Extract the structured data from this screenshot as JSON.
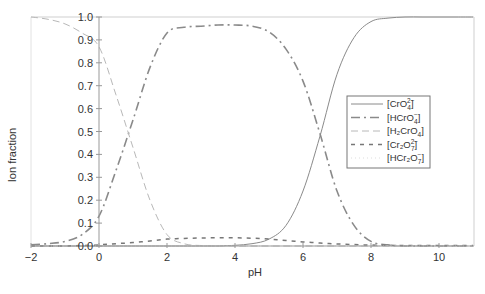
{
  "chart_data": {
    "type": "line",
    "title": "",
    "xlabel": "pH",
    "ylabel": "Ion fraction",
    "xlim": [
      -2,
      11
    ],
    "ylim": [
      0,
      1.0
    ],
    "x_ticks": [
      -2,
      0,
      2,
      4,
      6,
      8,
      10
    ],
    "x_tick_labels": [
      "−2",
      "0",
      "2",
      "4",
      "6",
      "8",
      "10"
    ],
    "y_ticks": [
      0.0,
      0.1,
      0.2,
      0.3,
      0.4,
      0.5,
      0.6,
      0.7,
      0.8,
      0.9,
      1.0
    ],
    "y_tick_labels": [
      "0.0",
      "0.1",
      "0.2",
      "0.3",
      "0.4",
      "0.5",
      "0.6",
      "0.7",
      "0.8",
      "0.9",
      "1.0"
    ],
    "grid": false,
    "legend_position": "right-center inside",
    "x": [
      -2,
      -1.5,
      -1,
      -0.5,
      0,
      0.5,
      1,
      1.5,
      2,
      2.5,
      3,
      3.5,
      4,
      4.5,
      5,
      5.5,
      6,
      6.5,
      7,
      7.5,
      8,
      8.5,
      9,
      9.5,
      10,
      10.5,
      11
    ],
    "series": [
      {
        "name": "[CrO4^2-]",
        "label": "[CrO₄²⁻]",
        "style": "solid",
        "values": [
          0,
          0,
          0,
          0,
          0,
          0,
          0,
          0,
          0,
          0,
          0,
          0,
          0.003,
          0.01,
          0.03,
          0.09,
          0.24,
          0.48,
          0.75,
          0.91,
          0.98,
          0.995,
          1.0,
          1.0,
          1.0,
          1.0,
          1.0
        ]
      },
      {
        "name": "[HCrO4^-]",
        "label": "[HCrO₄⁻]",
        "style": "dash-dot",
        "values": [
          0.005,
          0.01,
          0.02,
          0.05,
          0.13,
          0.33,
          0.55,
          0.78,
          0.93,
          0.955,
          0.96,
          0.965,
          0.965,
          0.96,
          0.935,
          0.86,
          0.72,
          0.49,
          0.24,
          0.09,
          0.02,
          0.005,
          0.0,
          0.0,
          0.0,
          0.0,
          0.0
        ]
      },
      {
        "name": "[H2CrO4]",
        "label": "[H₂CrO₄]",
        "style": "long-dash light",
        "values": [
          1.0,
          0.99,
          0.97,
          0.93,
          0.87,
          0.66,
          0.43,
          0.2,
          0.05,
          0.01,
          0.002,
          0,
          0,
          0,
          0,
          0,
          0,
          0,
          0,
          0,
          0,
          0,
          0,
          0,
          0,
          0,
          0
        ]
      },
      {
        "name": "[Cr2O7^2-]",
        "label": "[Cr₂O₇²⁻]",
        "style": "short-dash",
        "values": [
          0.0,
          0.0,
          0.0,
          0.002,
          0.005,
          0.01,
          0.015,
          0.022,
          0.03,
          0.033,
          0.035,
          0.036,
          0.036,
          0.034,
          0.03,
          0.024,
          0.018,
          0.013,
          0.009,
          0.006,
          0.004,
          0.003,
          0.002,
          0.002,
          0.002,
          0.002,
          0.002
        ]
      },
      {
        "name": "[HCr2O7^-]",
        "label": "[HCr₂O₇⁻]",
        "style": "dotted faint",
        "values": [
          0,
          0,
          0,
          0,
          0,
          0,
          0,
          0,
          0,
          0,
          0,
          0,
          0,
          0,
          0,
          0,
          0,
          0,
          0,
          0,
          0,
          0,
          0,
          0,
          0,
          0,
          0
        ]
      }
    ]
  },
  "legend": {
    "items": [
      {
        "base": "[CrO",
        "sub": "4",
        "sup": "2−",
        "end": "]"
      },
      {
        "base": "[HCrO",
        "sub": "4",
        "sup": "−",
        "end": "]"
      },
      {
        "base": "[H₂CrO",
        "sub": "4",
        "sup": "",
        "end": "]"
      },
      {
        "base": "[Cr₂O",
        "sub": "7",
        "sup": "2−",
        "end": "]"
      },
      {
        "base": "[HCr₂O",
        "sub": "7",
        "sup": "−",
        "end": "]"
      }
    ]
  },
  "colors": {
    "line": "#8a8a8a",
    "line_light": "#b8b8b8",
    "axis": "#999999",
    "text": "#333333"
  }
}
